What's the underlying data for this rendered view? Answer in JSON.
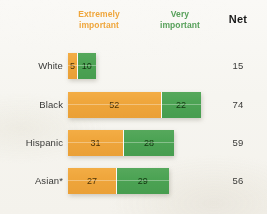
{
  "header": {
    "extremely_label": "Extremely\nimportant",
    "very_label": "Very\nimportant",
    "net_label": "Net"
  },
  "rows": [
    {
      "label": "White",
      "extremely": 5,
      "very": 10,
      "net": 15
    },
    {
      "label": "Black",
      "extremely": 52,
      "very": 22,
      "net": 74
    },
    {
      "label": "Hispanic",
      "extremely": 31,
      "very": 28,
      "net": 59
    },
    {
      "label": "Asian*",
      "extremely": 27,
      "very": 29,
      "net": 56
    }
  ],
  "colors": {
    "extremely": "#efa63c",
    "very": "#4ca354",
    "net_text": "#1a1a1a",
    "background": "#f7f6f1"
  },
  "chart_data": {
    "type": "bar",
    "title": "",
    "subtitle": "",
    "xlabel": "",
    "ylabel": "",
    "orientation": "horizontal",
    "stacked": true,
    "grid": false,
    "legend_position": "top",
    "xlim": [
      0,
      100
    ],
    "categories": [
      "White",
      "Black",
      "Hispanic",
      "Asian*"
    ],
    "series": [
      {
        "name": "Extremely important",
        "color": "#efa63c",
        "values": [
          5,
          52,
          31,
          27
        ]
      },
      {
        "name": "Very important",
        "color": "#4ca354",
        "values": [
          10,
          22,
          28,
          29
        ]
      }
    ],
    "net": {
      "name": "Net",
      "values": [
        15,
        74,
        59,
        56
      ]
    },
    "annotations": [
      "*"
    ],
    "pixels_per_unit": 1.78
  }
}
